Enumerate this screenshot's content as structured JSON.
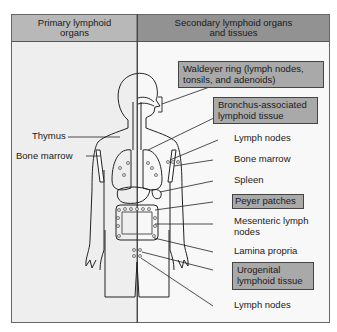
{
  "headers": {
    "primary": "Primary lymphoid organs",
    "secondary": "Secondary lymphoid organs and tissues"
  },
  "primary_labels": [
    {
      "text": "Thymus"
    },
    {
      "text": "Bone marrow"
    }
  ],
  "secondary_labels": {
    "waldeyer": "Waldeyer ring (lymph nodes, tonsils, and adenoids)",
    "waldeyer_line1": "Waldeyer ring (lymph nodes,",
    "waldeyer_line2": "tonsils, and adenoids)",
    "balt_line1": "Bronchus-associated",
    "balt_line2": "lymphoid tissue",
    "lymph_nodes_upper": "Lymph nodes",
    "bone_marrow": "Bone marrow",
    "spleen": "Spleen",
    "peyer": "Peyer patches",
    "mesenteric_line1": "Mesenteric lymph",
    "mesenteric_line2": "nodes",
    "lamina_propria": "Lamina propria",
    "urogenital_line1": "Urogenital",
    "urogenital_line2": "lymphoid tissue",
    "lymph_nodes_lower": "Lymph nodes"
  },
  "colors": {
    "header_left": "#b8b8b8",
    "header_right": "#929292",
    "highlight_box": "#a9a9a9",
    "panel_left": "#eeeeee",
    "panel_right": "#f8f8f8"
  }
}
